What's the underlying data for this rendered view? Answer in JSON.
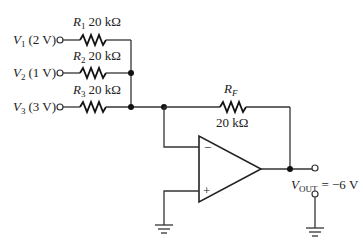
{
  "diagram": {
    "type": "summing-amplifier",
    "inputs": [
      {
        "name": "V",
        "sub": "1",
        "value": "(2 V)"
      },
      {
        "name": "V",
        "sub": "2",
        "value": "(1 V)"
      },
      {
        "name": "V",
        "sub": "3",
        "value": "(3 V)"
      }
    ],
    "resistors": [
      {
        "name": "R",
        "sub": "1",
        "value": "20 kΩ"
      },
      {
        "name": "R",
        "sub": "2",
        "value": "20 kΩ"
      },
      {
        "name": "R",
        "sub": "3",
        "value": "20 kΩ"
      }
    ],
    "feedback": {
      "name": "R",
      "sub": "F",
      "value": "20 kΩ"
    },
    "opamp": {
      "inverting": "−",
      "noninverting": "+"
    },
    "output": {
      "name": "V",
      "sub": "OUT",
      "eq": "= −6 V"
    },
    "colors": {
      "line": "#333333",
      "background": "#ffffff"
    }
  }
}
